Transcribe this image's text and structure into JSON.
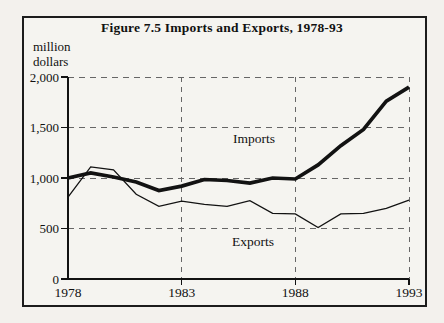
{
  "figure": {
    "title": "Figure 7.5 Imports and Exports, 1978-93",
    "unit_line1": "million",
    "unit_line2": "dollars",
    "imports_label": "Imports",
    "exports_label": "Exports"
  },
  "chart_data": {
    "type": "line",
    "title": "Figure 7.5 Imports and Exports, 1978-93",
    "ylabel": "million dollars",
    "xlabel": "",
    "x": [
      1978,
      1979,
      1980,
      1981,
      1982,
      1983,
      1984,
      1985,
      1986,
      1987,
      1988,
      1989,
      1990,
      1991,
      1992,
      1993
    ],
    "series": [
      {
        "name": "Imports",
        "style": "thick",
        "values": [
          1000,
          1050,
          1010,
          960,
          875,
          920,
          985,
          975,
          950,
          1000,
          990,
          1130,
          1320,
          1480,
          1760,
          1900
        ]
      },
      {
        "name": "Exports",
        "style": "thin",
        "values": [
          810,
          1110,
          1080,
          840,
          720,
          770,
          740,
          720,
          775,
          650,
          645,
          510,
          645,
          650,
          700,
          780
        ]
      }
    ],
    "xlim": [
      1978,
      1993
    ],
    "ylim": [
      0,
      2000
    ],
    "xticks": {
      "values": [
        1978,
        1983,
        1988,
        1993
      ],
      "labels": [
        "1978",
        "1983",
        "1988",
        "1993"
      ]
    },
    "yticks": {
      "values": [
        0,
        500,
        1000,
        1500,
        2000
      ],
      "labels": [
        "0",
        "500",
        "1,000",
        "1,500",
        "2,000"
      ]
    },
    "grid": {
      "style": "dashed",
      "horizontal_at": [
        500,
        1000,
        1500,
        2000
      ],
      "vertical_at": [
        1983,
        1988,
        1993
      ]
    },
    "legend_position": "inline-labels"
  },
  "colors": {
    "line": "#121212",
    "grid": "#666666",
    "text": "#111111",
    "background": "#f3f1ed",
    "frame_border": "#1c1c1c"
  }
}
